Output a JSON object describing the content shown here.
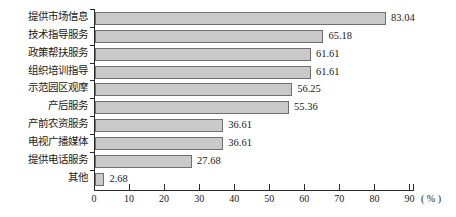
{
  "chart_data": {
    "type": "bar",
    "orientation": "horizontal",
    "title": "",
    "xlabel": "(%)",
    "ylabel": "",
    "xlim": [
      0,
      90
    ],
    "xticks": [
      "0",
      "10",
      "20",
      "30",
      "40",
      "50",
      "60",
      "70",
      "80",
      "90"
    ],
    "grid": false,
    "legend": null,
    "unit_label": "( % )",
    "categories": [
      "提供市场信息",
      "技术指导服务",
      "政策帮扶服务",
      "组织培训指导",
      "示范园区观摩",
      "产后服务",
      "产前农资服务",
      "电视广播媒体",
      "提供电话服务",
      "其他"
    ],
    "values": [
      83.04,
      65.18,
      61.61,
      61.61,
      56.25,
      55.36,
      36.61,
      36.61,
      27.68,
      2.68
    ],
    "value_labels": [
      "83.04",
      "65.18",
      "61.61",
      "61.61",
      "56.25",
      "55.36",
      "36.61",
      "36.61",
      "27.68",
      "2.68"
    ],
    "bar_fill_color": "#c9c9c9",
    "bar_border_color": "#6f6f6f",
    "axis_color": "#2b2b2b"
  }
}
